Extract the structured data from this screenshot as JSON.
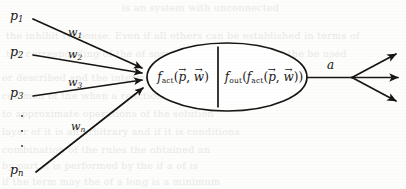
{
  "figure": {
    "background_color": "#fdfdfc",
    "ink_color": "#15120f"
  },
  "inputs": [
    {
      "id": "p1",
      "label_base": "p",
      "label_sub": "1",
      "x": 10,
      "y": 8
    },
    {
      "id": "p2",
      "label_base": "p",
      "label_sub": "2",
      "x": 10,
      "y": 44
    },
    {
      "id": "p3",
      "label_base": "p",
      "label_sub": "3",
      "x": 10,
      "y": 85
    },
    {
      "id": "pn",
      "label_base": "p",
      "label_sub": "n",
      "x": 10,
      "y": 162
    }
  ],
  "weights": [
    {
      "id": "w1",
      "label_base": "w",
      "label_sub": "1",
      "x": 68,
      "y": 26
    },
    {
      "id": "w2",
      "label_base": "w",
      "label_sub": "2",
      "x": 68,
      "y": 48
    },
    {
      "id": "w3",
      "label_base": "w",
      "label_sub": "3",
      "x": 68,
      "y": 76
    },
    {
      "id": "wn",
      "label_base": "w",
      "label_sub": "n",
      "x": 71,
      "y": 120
    }
  ],
  "ellipsis": {
    "name": "vertical-ellipsis",
    "dot_count": 3,
    "x": 21,
    "y": 115
  },
  "neuron": {
    "left_cell": {
      "fn": "f",
      "fn_sub": "act",
      "open": "(",
      "arg1": "p",
      "comma": ", ",
      "arg2": "w",
      "close": ")",
      "plain": "f_act(p, w)"
    },
    "right_cell": {
      "fn": "f",
      "fn_sub": "out",
      "open": "(",
      "inner_fn": "f",
      "inner_fn_sub": "act",
      "inner_open": "(",
      "arg1": "p",
      "comma": ", ",
      "arg2": "w",
      "inner_close": ")",
      "close": ")",
      "plain": "f_out(f_act(p, w))"
    },
    "vector_arrow": "→",
    "ellipse": {
      "cx": 227,
      "cy": 77,
      "rx": 80,
      "ry": 34
    },
    "divider_x": 218
  },
  "output": {
    "label": "a",
    "axon_start_x": 307,
    "axon_end_x": 352,
    "branch_count": 3
  },
  "bleed_text": [
    {
      "text": "is an system with unconnected",
      "x": 122,
      "y": 2
    },
    {
      "text": "the inhibit response. Even if all others can be established in terms of",
      "x": 6,
      "y": 30
    },
    {
      "text": "the corresponding of the of some  possible  state and   of  the be  used",
      "x": 6,
      "y": 48
    },
    {
      "text": "or described and the intermediate of the values",
      "x": 2,
      "y": 72
    },
    {
      "text": "common  of the   when a reaction  of  the to be a series",
      "x": 2,
      "y": 90
    },
    {
      "text": "to  approximate  operations  of   the  solution",
      "x": 2,
      "y": 108
    },
    {
      "text": "layer of  it  is  an  arbitrary  and  if  it  is  conditions",
      "x": 2,
      "y": 126
    },
    {
      "text": "combination  of  the   rules   the   obtained   an",
      "x": 2,
      "y": 144
    },
    {
      "text": "by  part  it  is   performed   by   the   if   a  of  is",
      "x": 2,
      "y": 160
    },
    {
      "text": "if  the  term  may  the   of   a  long  is  a  minimum",
      "x": 2,
      "y": 176
    }
  ]
}
